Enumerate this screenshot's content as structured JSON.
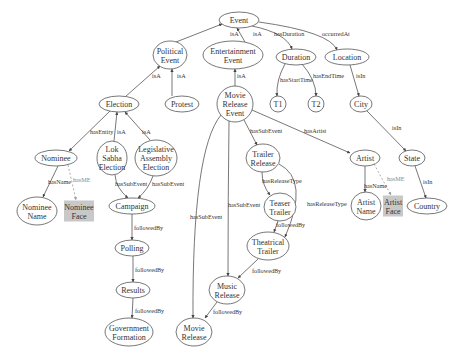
{
  "diagram": {
    "colors": {
      "node_stroke": "#555555",
      "media_fill": "#c8c8c8",
      "edge": "#555555",
      "me_edge": "#999999"
    },
    "nodes": [
      {
        "id": "event",
        "label": "Event",
        "lines": [
          "Event"
        ],
        "cx": 239,
        "cy": 20,
        "rx": 20,
        "ry": 8
      },
      {
        "id": "political_event",
        "label": "Political Event",
        "lines": [
          "Political",
          "Event"
        ],
        "cx": 170,
        "cy": 55,
        "rx": 17,
        "ry": 14
      },
      {
        "id": "entertainment_event",
        "label": "Entertainment Event",
        "lines": [
          "Entertainment",
          "Event"
        ],
        "cx": 233,
        "cy": 55,
        "rx": 30,
        "ry": 14
      },
      {
        "id": "duration",
        "label": "Duration",
        "lines": [
          "Duration"
        ],
        "cx": 296,
        "cy": 57,
        "rx": 20,
        "ry": 8
      },
      {
        "id": "location",
        "label": "Location",
        "lines": [
          "Location"
        ],
        "cx": 347,
        "cy": 57,
        "rx": 22,
        "ry": 8
      },
      {
        "id": "election",
        "label": "Election",
        "lines": [
          "Election"
        ],
        "cx": 119,
        "cy": 104,
        "rx": 20,
        "ry": 8
      },
      {
        "id": "protest",
        "label": "Protest",
        "lines": [
          "Protest"
        ],
        "cx": 182,
        "cy": 104,
        "rx": 17,
        "ry": 8
      },
      {
        "id": "movie_release_event",
        "label": "Movie Release Event",
        "lines": [
          "Movie",
          "Release",
          "Event"
        ],
        "cx": 235,
        "cy": 104,
        "rx": 18,
        "ry": 18
      },
      {
        "id": "t1",
        "label": "T1",
        "lines": [
          "T1"
        ],
        "cx": 278,
        "cy": 104,
        "rx": 8,
        "ry": 8
      },
      {
        "id": "t2",
        "label": "T2",
        "lines": [
          "T2"
        ],
        "cx": 316,
        "cy": 104,
        "rx": 8,
        "ry": 8
      },
      {
        "id": "city",
        "label": "City",
        "lines": [
          "City"
        ],
        "cx": 361,
        "cy": 104,
        "rx": 11,
        "ry": 8
      },
      {
        "id": "nominee",
        "label": "Nominee",
        "lines": [
          "Nominee"
        ],
        "cx": 56,
        "cy": 158,
        "rx": 21,
        "ry": 8
      },
      {
        "id": "lok_sabha_election",
        "label": "Lok Sabha Election",
        "lines": [
          "Lok",
          "Sabha",
          "Election"
        ],
        "cx": 112,
        "cy": 158,
        "rx": 15,
        "ry": 17
      },
      {
        "id": "legislative_assembly_election",
        "label": "Legislative Assembly Election",
        "lines": [
          "Legislative",
          "Assembly",
          "Election"
        ],
        "cx": 156,
        "cy": 158,
        "rx": 21,
        "ry": 18
      },
      {
        "id": "trailer_release",
        "label": "Trailer Release",
        "lines": [
          "Trailer",
          "Release"
        ],
        "cx": 263,
        "cy": 158,
        "rx": 17,
        "ry": 14
      },
      {
        "id": "artist",
        "label": "Artist",
        "lines": [
          "Artist"
        ],
        "cx": 365,
        "cy": 158,
        "rx": 15,
        "ry": 8
      },
      {
        "id": "state",
        "label": "State",
        "lines": [
          "State"
        ],
        "cx": 412,
        "cy": 158,
        "rx": 13,
        "ry": 8
      },
      {
        "id": "nominee_name",
        "label": "Nominee Name",
        "lines": [
          "Nominee",
          "Name"
        ],
        "cx": 37,
        "cy": 211,
        "rx": 20,
        "ry": 14
      },
      {
        "id": "nominee_face",
        "label": "Nominee Face",
        "lines": [
          "Nominee",
          "Face"
        ],
        "cx": 79,
        "cy": 211,
        "w": 30,
        "h": 21,
        "media": true
      },
      {
        "id": "campaign",
        "label": "Campaign",
        "lines": [
          "Campaign"
        ],
        "cx": 132,
        "cy": 206,
        "rx": 23,
        "ry": 8
      },
      {
        "id": "teaser_trailer",
        "label": "Teaser Trailer",
        "lines": [
          "Teaser",
          "Trailer"
        ],
        "cx": 280,
        "cy": 207,
        "rx": 16,
        "ry": 14
      },
      {
        "id": "artist_name",
        "label": "Artist Name",
        "lines": [
          "Artist",
          "Name"
        ],
        "cx": 366,
        "cy": 206,
        "rx": 15,
        "ry": 14
      },
      {
        "id": "artist_face",
        "label": "Artist Face",
        "lines": [
          "Artist",
          "Face"
        ],
        "cx": 393,
        "cy": 206,
        "w": 20,
        "h": 21,
        "media": true
      },
      {
        "id": "country",
        "label": "Country",
        "lines": [
          "Country"
        ],
        "cx": 427,
        "cy": 206,
        "rx": 20,
        "ry": 8
      },
      {
        "id": "polling",
        "label": "Polling",
        "lines": [
          "Polling"
        ],
        "cx": 132,
        "cy": 248,
        "rx": 17,
        "ry": 8
      },
      {
        "id": "theatrical_trailer",
        "label": "Theatrical Trailer",
        "lines": [
          "Theatrical",
          "Trailer"
        ],
        "cx": 268,
        "cy": 246,
        "rx": 21,
        "ry": 14
      },
      {
        "id": "results",
        "label": "Results",
        "lines": [
          "Results"
        ],
        "cx": 133,
        "cy": 290,
        "rx": 17,
        "ry": 8
      },
      {
        "id": "music_release",
        "label": "Music Release",
        "lines": [
          "Music",
          "Release"
        ],
        "cx": 227,
        "cy": 290,
        "rx": 18,
        "ry": 14
      },
      {
        "id": "government_formation",
        "label": "Government Formation",
        "lines": [
          "Government",
          "Formation"
        ],
        "cx": 129,
        "cy": 332,
        "rx": 24,
        "ry": 14
      },
      {
        "id": "movie_release",
        "label": "Movie Release",
        "lines": [
          "Movie",
          "Release"
        ],
        "cx": 194,
        "cy": 332,
        "rx": 18,
        "ry": 14
      }
    ],
    "edges": [
      {
        "from": "political_event",
        "to": "event",
        "label": "isA",
        "path": "M176,42 L222,24",
        "lx": 230,
        "ly": 36
      },
      {
        "from": "entertainment_event",
        "to": "event",
        "label": "isA",
        "path": "M245,42 L237,28",
        "lx": 253,
        "ly": 36
      },
      {
        "from": "event",
        "to": "duration",
        "label": "hasDuration",
        "path": "M252,26 Q286,33 292,49",
        "lx": 274,
        "ly": 36
      },
      {
        "from": "event",
        "to": "location",
        "label": "occurredAt",
        "path": "M259,22 Q330,32 337,50",
        "lx": 322,
        "ly": 36
      },
      {
        "from": "election",
        "to": "political_event",
        "label": "isA",
        "path": "M125,97 L160,66",
        "lx": 152,
        "ly": 78
      },
      {
        "from": "protest",
        "to": "political_event",
        "label": "isA",
        "path": "M172,96 L172,69",
        "lx": 177,
        "ly": 78
      },
      {
        "from": "movie_release_event",
        "to": "entertainment_event",
        "label": "isA",
        "path": "M235,86 L235,69",
        "lx": 237,
        "ly": 78
      },
      {
        "from": "duration",
        "to": "t1",
        "label": "hasStartTime",
        "path": "M285,64 Q276,80 277,96",
        "lx": 280,
        "ly": 82
      },
      {
        "from": "duration",
        "to": "t2",
        "label": "hasEndTime",
        "path": "M302,64 Q316,80 316,96",
        "lx": 313,
        "ly": 78
      },
      {
        "from": "location",
        "to": "city",
        "label": "isIn",
        "path": "M350,65 L359,96",
        "lx": 356,
        "ly": 78
      },
      {
        "from": "city",
        "to": "state",
        "label": "isIn",
        "path": "M367,111 L406,151",
        "lx": 392,
        "ly": 130
      },
      {
        "from": "state",
        "to": "country",
        "label": "isIn",
        "path": "M415,166 L426,198",
        "lx": 423,
        "ly": 184
      },
      {
        "from": "election",
        "to": "nominee",
        "label": "hasEntity",
        "path": "M110,111 L69,151",
        "lx": 90,
        "ly": 134
      },
      {
        "from": "lok_sabha_election",
        "to": "election",
        "label": "isA",
        "path": "M114,141 L117,112",
        "lx": 117,
        "ly": 134
      },
      {
        "from": "legislative_assembly_election",
        "to": "election",
        "label": "isA",
        "path": "M150,140 L125,112",
        "lx": 142,
        "ly": 134
      },
      {
        "from": "nominee",
        "to": "nominee_name",
        "label": "hasName",
        "path": "M58,166 L43,197",
        "lx": 48,
        "ly": 184
      },
      {
        "from": "nominee",
        "to": "nominee_face",
        "label": "hasME",
        "path": "M68,165 L76,200",
        "lx": 73,
        "ly": 182,
        "me": true
      },
      {
        "from": "lok_sabha_election",
        "to": "campaign",
        "label": "hasSubEvent",
        "path": "M115,175 Q116,188 128,198",
        "lx": 115,
        "ly": 186
      },
      {
        "from": "legislative_assembly_election",
        "to": "campaign",
        "label": "hasSubEvent",
        "path": "M153,176 Q148,190 138,198",
        "lx": 152,
        "ly": 186
      },
      {
        "from": "campaign",
        "to": "polling",
        "label": "followedBy",
        "path": "M132,214 L132,240",
        "lx": 134,
        "ly": 230
      },
      {
        "from": "polling",
        "to": "results",
        "label": "followedBy",
        "path": "M133,256 L133,282",
        "lx": 135,
        "ly": 272
      },
      {
        "from": "results",
        "to": "government_formation",
        "label": "followedBy",
        "path": "M133,298 L132,318",
        "lx": 135,
        "ly": 313
      },
      {
        "from": "movie_release_event",
        "to": "trailer_release",
        "label": "hasSubEvent",
        "path": "M244,120 L257,145",
        "lx": 250,
        "ly": 133
      },
      {
        "from": "movie_release_event",
        "to": "artist",
        "label": "hasArtist",
        "path": "M252,110 L350,153",
        "lx": 304,
        "ly": 133
      },
      {
        "from": "movie_release_event",
        "to": "music_release",
        "label": "hasSubEvent",
        "path": "M229,121 Q228,200 228,276",
        "lx": 228,
        "ly": 207
      },
      {
        "from": "movie_release_event",
        "to": "movie_release",
        "label": "hasSubEvent",
        "path": "M221,115 Q192,150 193,318",
        "lx": 190,
        "ly": 219
      },
      {
        "from": "trailer_release",
        "to": "teaser_trailer",
        "label": "hasReleaseType",
        "path": "M262,172 Q262,185 270,195",
        "lx": 262,
        "ly": 183
      },
      {
        "from": "trailer_release",
        "to": "theatrical_trailer",
        "label": "hasReleaseType",
        "path": "M279,164 Q310,180 285,237",
        "lx": 307,
        "ly": 206
      },
      {
        "from": "teaser_trailer",
        "to": "theatrical_trailer",
        "label": "followedBy",
        "path": "M278,221 L274,232",
        "lx": 276,
        "ly": 227
      },
      {
        "from": "theatrical_trailer",
        "to": "music_release",
        "label": "followedBy",
        "path": "M258,259 L238,278",
        "lx": 252,
        "ly": 273
      },
      {
        "from": "music_release",
        "to": "movie_release",
        "label": "followedBy",
        "path": "M217,302 L205,318",
        "lx": 213,
        "ly": 314
      },
      {
        "from": "artist",
        "to": "artist_name",
        "label": "hasName",
        "path": "M365,166 L365,192",
        "lx": 364,
        "ly": 188
      },
      {
        "from": "artist",
        "to": "artist_face",
        "label": "hasME",
        "path": "M374,164 L391,195",
        "lx": 387,
        "ly": 181,
        "me": true
      }
    ]
  }
}
